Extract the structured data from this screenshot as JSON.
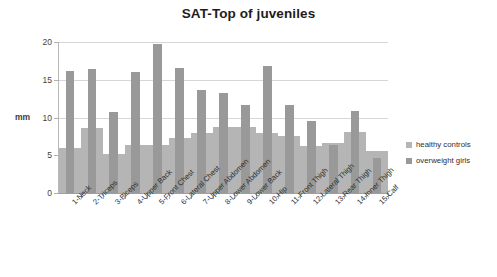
{
  "chart_data": {
    "type": "bar",
    "title": "SAT-Top of  juveniles",
    "xlabel": "",
    "ylabel": "mm",
    "ylim": [
      0,
      20
    ],
    "yticks": [
      0,
      5,
      10,
      15,
      20
    ],
    "grid": true,
    "legend_position": "right",
    "categories": [
      "1-Neck",
      "2-Triceps",
      "3-Biceps",
      "4-Upper Back",
      "5-Front Chest",
      "6-Lateral Chest",
      "7-Upper Abdomen",
      "8-Lower Abdomen",
      "9-Lower Back",
      "10-Hip",
      "11-Front Thigh",
      "12-Lateral Thigh",
      "13-Rear Thigh",
      "14-Inner Thigh",
      "15-Calf"
    ],
    "series": [
      {
        "name": "healthy controls",
        "color": "#b5b5b5",
        "values": [
          6.0,
          8.6,
          5.2,
          6.4,
          6.4,
          7.3,
          8.0,
          8.7,
          8.7,
          8.0,
          7.6,
          6.2,
          6.6,
          8.1,
          5.6
        ]
      },
      {
        "name": "overweight girls",
        "color": "#999999",
        "values": [
          16.1,
          16.4,
          10.7,
          16.0,
          19.7,
          16.6,
          13.7,
          13.2,
          11.6,
          16.8,
          11.6,
          9.5,
          6.4,
          10.8,
          4.6
        ]
      }
    ]
  },
  "legend": {
    "items": [
      {
        "label": "healthy controls",
        "color": "#b5b5b5"
      },
      {
        "label": "overweight girls",
        "color": "#999999"
      }
    ]
  }
}
